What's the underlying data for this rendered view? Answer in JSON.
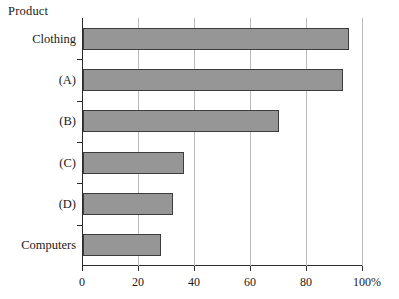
{
  "chart_data": {
    "type": "bar",
    "orientation": "horizontal",
    "title": "",
    "ylabel": "Product",
    "xlabel": "",
    "unit": "%",
    "categories": [
      "Clothing",
      "(A)",
      "(B)",
      "(C)",
      "(D)",
      "Computers"
    ],
    "values": [
      95,
      93,
      70,
      36,
      32,
      28
    ],
    "xlim": [
      0,
      100
    ],
    "xticks": [
      0,
      20,
      40,
      60,
      80,
      100
    ],
    "xtick_labels": [
      "0",
      "20",
      "40",
      "60",
      "80",
      "100"
    ],
    "grid": true,
    "grid_axis": "x",
    "legend": null,
    "series": [
      {
        "name": "Product share",
        "values": [
          95,
          93,
          70,
          36,
          32,
          28
        ]
      }
    ],
    "colors": {
      "bar_fill": "#969696",
      "bar_border": "#3c3c3c",
      "axis": "#2b2b2b",
      "gridline": "#b9b9b9",
      "text": "#1a1a1a",
      "background": "#ffffff"
    }
  }
}
